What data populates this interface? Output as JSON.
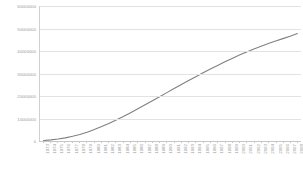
{
  "chart_data": {
    "type": "line",
    "title": "",
    "subtitle": "",
    "xlabel": "",
    "ylabel": "",
    "ylim": [
      0,
      60000000
    ],
    "ytick_labels": [
      "60000000",
      "50000000",
      "40000000",
      "30000000",
      "20000000",
      "10000000",
      "0"
    ],
    "ytick_values": [
      60000000,
      50000000,
      40000000,
      30000000,
      20000000,
      10000000,
      0
    ],
    "grid": true,
    "legend": false,
    "legend_position": "none",
    "line_color": "#808080",
    "gridline_color": "#e2e2e2",
    "axis_color": "#c8c8c8",
    "label_color": "#9a9a9a",
    "background_color": "#ffffff",
    "categories": [
      "1973",
      "1974",
      "1975",
      "1976",
      "1977",
      "1978",
      "1979",
      "1980",
      "1981",
      "1982",
      "1983",
      "1984",
      "1985",
      "1986",
      "1987",
      "1988",
      "1989",
      "1990",
      "1991",
      "1992",
      "1993",
      "1994",
      "1995",
      "1996",
      "1997",
      "1998",
      "1999",
      "2000",
      "2001",
      "2002",
      "2003",
      "2004",
      "2005",
      "2006",
      "2007",
      "2008"
    ],
    "values": [
      200000,
      500000,
      900000,
      1400000,
      2100000,
      2900000,
      3900000,
      5100000,
      6400000,
      7800000,
      9300000,
      10900000,
      12600000,
      14300000,
      16100000,
      17900000,
      19700000,
      21500000,
      23300000,
      25100000,
      26900000,
      28600000,
      30300000,
      32000000,
      33600000,
      35200000,
      36700000,
      38200000,
      39600000,
      40900000,
      42100000,
      43300000,
      44400000,
      45500000,
      46600000,
      47800000
    ]
  }
}
